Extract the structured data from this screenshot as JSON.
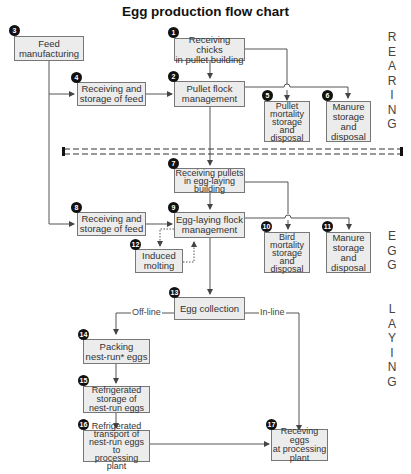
{
  "title": "Egg production flow chart",
  "phases": {
    "rearing": "R\nE\nA\nR\nI\nN\nG",
    "egg": "E\nG\nG",
    "laying": "L\nA\nY\nI\nN\nG"
  },
  "nodes": [
    {
      "id": 1,
      "label": "Receiving chicks\nin pullet building"
    },
    {
      "id": 2,
      "label": "Pullet flock\nmanagement"
    },
    {
      "id": 3,
      "label": "Feed\nmanufacturing"
    },
    {
      "id": 4,
      "label": "Receiving and\nstorage of feed"
    },
    {
      "id": 5,
      "label": "Pullet\nmortality\nstorage\nand\ndisposal"
    },
    {
      "id": 6,
      "label": "Manure\nstorage\nand\ndisposal"
    },
    {
      "id": 7,
      "label": "Receiving pullets\nin egg-laying\nbuilding"
    },
    {
      "id": 8,
      "label": "Receiving and\nstorage of feed"
    },
    {
      "id": 9,
      "label": "Egg-laying flock\nmanagement"
    },
    {
      "id": 10,
      "label": "Bird\nmortality\nstorage\nand\ndisposal"
    },
    {
      "id": 11,
      "label": "Manure\nstorage\nand\ndisposal"
    },
    {
      "id": 12,
      "label": "Induced\nmolting"
    },
    {
      "id": 13,
      "label": "Egg collection"
    },
    {
      "id": 14,
      "label": "Packing\nnest-run* eggs"
    },
    {
      "id": 15,
      "label": "Refrigerated\nstorage of\nnest-run eggs"
    },
    {
      "id": 16,
      "label": "Refrigerated\ntransport of\nnest-run eggs to\nprocessing plant"
    },
    {
      "id": 17,
      "label": "Receving eggs\nat processing\nplant"
    }
  ],
  "edge_labels": {
    "offline": "Off-line",
    "inline": "In-line"
  },
  "colors": {
    "box_fill": "#ececec",
    "box_border": "#777777",
    "line": "#555555",
    "badge": "#111111"
  }
}
